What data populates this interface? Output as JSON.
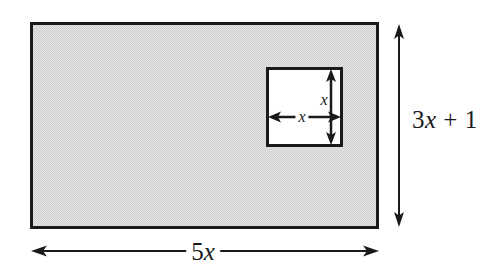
{
  "figure": {
    "background_color": "#ffffff",
    "stroke_color": "#1a1a1a"
  },
  "outer_rectangle": {
    "name": "shaded-rectangle",
    "fill_color": "#dcdcdc",
    "stroke_color": "#1a1a1a",
    "x": 31,
    "y": 23,
    "width": 347,
    "height": 205
  },
  "inner_square": {
    "name": "white-square-cutout",
    "fill_color": "#ffffff",
    "stroke_color": "#1a1a1a",
    "x": 267,
    "y": 68,
    "width": 75,
    "height": 78
  },
  "labels": {
    "height": {
      "prefix": "3",
      "variable": "x",
      "suffix": " + 1",
      "full_text": "3x + 1"
    },
    "width": {
      "prefix": "5",
      "variable": "x",
      "suffix": "",
      "full_text": "5x"
    },
    "inner_height": {
      "variable": "x",
      "full_text": "x"
    },
    "inner_width": {
      "variable": "x",
      "full_text": "x"
    }
  },
  "dimension_arrows": [
    {
      "name": "height-dimension-arrow",
      "orientation": "vertical",
      "label": "3x + 1",
      "x": 399,
      "y1": 26,
      "y2": 225
    },
    {
      "name": "width-dimension-arrow",
      "orientation": "horizontal",
      "label": "5x",
      "y": 251,
      "x1": 32,
      "x2": 378
    },
    {
      "name": "inner-height-dimension-arrow",
      "orientation": "vertical",
      "label": "x",
      "x": 331,
      "y1": 70,
      "y2": 144
    },
    {
      "name": "inner-width-dimension-arrow",
      "orientation": "horizontal",
      "label": "x",
      "y": 117,
      "x1": 269,
      "x2": 340
    }
  ]
}
